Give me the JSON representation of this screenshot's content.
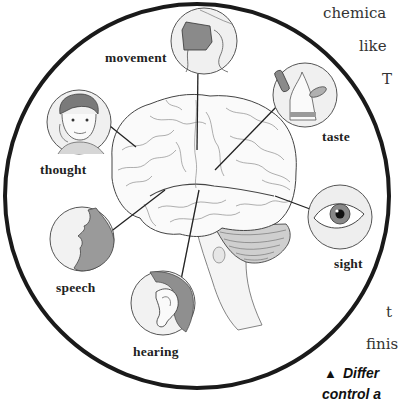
{
  "figure": {
    "regions": [
      {
        "id": "movement",
        "label": "movement"
      },
      {
        "id": "taste",
        "label": "taste"
      },
      {
        "id": "thought",
        "label": "thought"
      },
      {
        "id": "sight",
        "label": "sight"
      },
      {
        "id": "speech",
        "label": "speech"
      },
      {
        "id": "hearing",
        "label": "hearing"
      }
    ]
  },
  "side_text": {
    "lines": [
      "chemica",
      "like",
      "T",
      "t",
      "finis"
    ]
  },
  "caption": {
    "marker": "▲",
    "text": "Differ",
    "next_line": "control a"
  },
  "colors": {
    "outline": "#1a1a1a",
    "circle_fill": "#f2f2f2",
    "shade": "#8a8a8a",
    "text": "#222222"
  }
}
